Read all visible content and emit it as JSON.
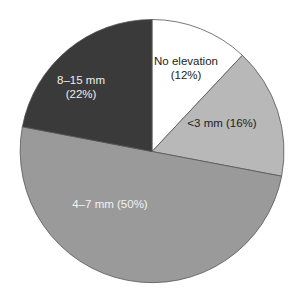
{
  "chart_data": {
    "type": "pie",
    "title": "",
    "start_angle_deg": 0,
    "direction": "clockwise",
    "categories": [
      "No elevation",
      "<3 mm",
      "4–7 mm",
      "8–15 mm"
    ],
    "values": [
      12,
      16,
      50,
      22
    ],
    "colors": [
      "#ffffff",
      "#b8b8b8",
      "#9a9a9a",
      "#3a3a3a"
    ],
    "label_colors": [
      "#222222",
      "#222222",
      "#f2f2f2",
      "#eeeeee"
    ],
    "labels": [
      {
        "lines": [
          "No elevation",
          "(12%)"
        ]
      },
      {
        "lines": [
          "<3 mm (16%)"
        ]
      },
      {
        "lines": [
          "4–7 mm (50%)"
        ]
      },
      {
        "lines": [
          "8–15 mm",
          "(22%)"
        ]
      }
    ],
    "unit": "%",
    "legend": "none"
  },
  "geometry": {
    "cx": 152,
    "cy": 151.5,
    "r": 132
  },
  "label_positions": [
    {
      "x": 186,
      "y": 65
    },
    {
      "x": 222,
      "y": 127
    },
    {
      "x": 110,
      "y": 208
    },
    {
      "x": 81,
      "y": 84
    }
  ]
}
